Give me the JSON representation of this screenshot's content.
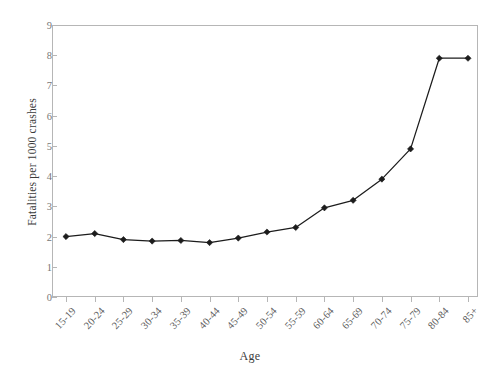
{
  "chart_data": {
    "type": "line",
    "title": "",
    "xlabel": "Age",
    "ylabel": "Fatalities per 1000 crashes",
    "categories": [
      "15-19",
      "20-24",
      "25-29",
      "30-34",
      "35-39",
      "40-44",
      "45-49",
      "50-54",
      "55-59",
      "60-64",
      "65-69",
      "70-74",
      "75-79",
      "80-84",
      "85+"
    ],
    "values": [
      2.0,
      2.1,
      1.9,
      1.85,
      1.87,
      1.8,
      1.95,
      2.15,
      2.3,
      2.95,
      3.2,
      3.9,
      4.9,
      7.9,
      7.9
    ],
    "series": [
      {
        "name": "Fatalities per 1000 crashes",
        "values": [
          2.0,
          2.1,
          1.9,
          1.85,
          1.87,
          1.8,
          1.95,
          2.15,
          2.3,
          2.95,
          3.2,
          3.9,
          4.9,
          7.9,
          7.9
        ]
      }
    ],
    "ylim": [
      0,
      9
    ],
    "yticks": [
      0,
      1,
      2,
      3,
      4,
      5,
      6,
      7,
      8,
      9
    ],
    "ytick_labels": [
      "0",
      "1",
      "2",
      "3",
      "4",
      "5",
      "6",
      "7",
      "8",
      "9"
    ],
    "grid": false,
    "legend": false,
    "legend_position": "none",
    "marker": "diamond",
    "line_color": "#1c1c1c",
    "marker_color": "#1c1c1c",
    "axis_color": "#b6b6b6",
    "tick_label_color": "#777777",
    "frame": "box"
  }
}
